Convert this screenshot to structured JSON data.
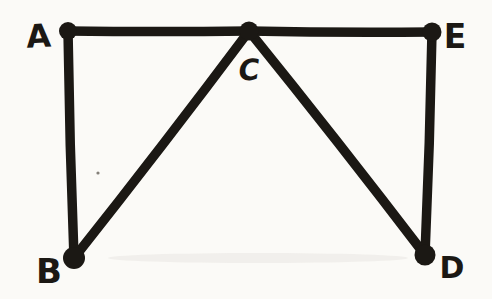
{
  "figure": {
    "background_color": "#fbfaf7",
    "ink_color": "#1b1814",
    "stroke_width": 9.5,
    "canvas": {
      "width": 492,
      "height": 299
    },
    "vertices": [
      {
        "id": "A",
        "label": "A",
        "x": 68,
        "y": 31,
        "dot_radius": 9,
        "label_x": 39,
        "label_y": 47,
        "font_size": 32,
        "italic": false,
        "tilt": -3
      },
      {
        "id": "B",
        "label": "B",
        "x": 74,
        "y": 258,
        "dot_radius": 11,
        "label_x": 49,
        "label_y": 283,
        "font_size": 34,
        "italic": false,
        "tilt": 0
      },
      {
        "id": "C",
        "label": "C",
        "x": 249,
        "y": 31,
        "dot_radius": 9.5,
        "label_x": 250,
        "label_y": 80,
        "font_size": 29,
        "italic": true,
        "tilt": -4
      },
      {
        "id": "D",
        "label": "D",
        "x": 425,
        "y": 255,
        "dot_radius": 10.5,
        "label_x": 452,
        "label_y": 278,
        "font_size": 30,
        "italic": false,
        "tilt": 0
      },
      {
        "id": "E",
        "label": "E",
        "x": 432,
        "y": 32,
        "dot_radius": 9.5,
        "label_x": 455,
        "label_y": 48,
        "font_size": 33,
        "italic": false,
        "tilt": 0
      }
    ],
    "edges": [
      {
        "from": "A",
        "to": "C",
        "bow": 1
      },
      {
        "from": "C",
        "to": "E",
        "bow": 1.5
      },
      {
        "from": "A",
        "to": "B",
        "bow": 1.5
      },
      {
        "from": "E",
        "to": "D",
        "bow": -1.5
      },
      {
        "from": "B",
        "to": "C",
        "bow": 2
      },
      {
        "from": "C",
        "to": "D",
        "bow": -2
      }
    ],
    "paper_marks": [
      {
        "id": "ink-speck",
        "type": "speck",
        "x": 98,
        "y": 173,
        "radius": 1.6,
        "color": "#6f6a63",
        "opacity": 0.85
      },
      {
        "id": "scan-smudge",
        "type": "smudge",
        "x": 258,
        "y": 258,
        "rx": 150,
        "ry": 5,
        "color": "#b8b3a9",
        "opacity": 0.14
      }
    ]
  }
}
